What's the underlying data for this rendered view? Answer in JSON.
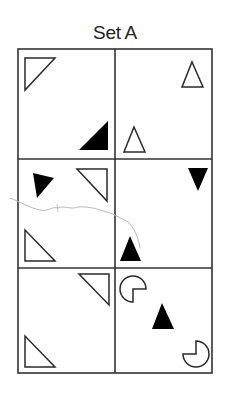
{
  "title": "Set A",
  "colors": {
    "ink": "#2a2a2a",
    "grid": "#333333",
    "scribble": "#b8b8b8",
    "background": "#ffffff"
  },
  "grid": {
    "rows": 3,
    "cols": 2
  },
  "cells": [
    {
      "row": 0,
      "col": 0,
      "shapes": [
        "outline-right-triangle-top-left",
        "filled-right-triangle-bottom-right"
      ]
    },
    {
      "row": 0,
      "col": 1,
      "shapes": [
        "outline-triangle-up",
        "outline-triangle-up"
      ]
    },
    {
      "row": 1,
      "col": 0,
      "shapes": [
        "filled-triangle-rotated",
        "outline-right-triangle-top-right",
        "outline-right-triangle-bottom-left"
      ]
    },
    {
      "row": 1,
      "col": 1,
      "shapes": [
        "filled-triangle-down",
        "filled-triangle-up"
      ]
    },
    {
      "row": 2,
      "col": 0,
      "shapes": [
        "outline-right-triangle-top-right",
        "outline-right-triangle-bottom-left"
      ]
    },
    {
      "row": 2,
      "col": 1,
      "shapes": [
        "pacman-missing-bottom-right",
        "filled-triangle-up",
        "pacman-missing-top-left"
      ]
    }
  ]
}
